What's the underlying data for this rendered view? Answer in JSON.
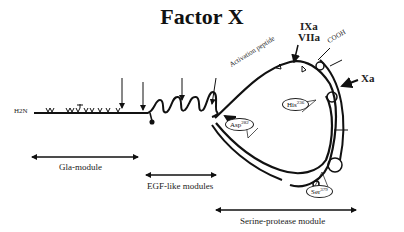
{
  "title": "Factor X",
  "labels": {
    "n_terminus": "H2N",
    "activation_peptide": "Activation peptide",
    "cooh": "COOH",
    "cleavage_enzymes_line1": "IXa",
    "cleavage_enzymes_line2": "VIIa",
    "xa": "Xa"
  },
  "residues": [
    {
      "name": "His",
      "number": "236"
    },
    {
      "name": "Asp",
      "number": "282"
    },
    {
      "name": "Ser",
      "number": "379"
    }
  ],
  "modules": [
    {
      "label": "Gla-module"
    },
    {
      "label": "EGF-like modules"
    },
    {
      "label": "Serine-protease module"
    }
  ],
  "colors": {
    "line": "#111111",
    "background": "#ffffff"
  }
}
